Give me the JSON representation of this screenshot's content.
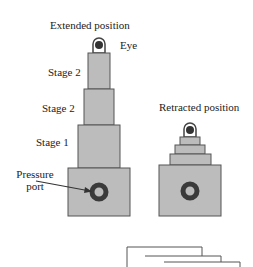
{
  "title_extended": "Extended position",
  "title_retracted": "Retracted position",
  "labels": {
    "eye": "Eye",
    "stage_top": "Stage 2",
    "stage_mid": "Stage 2",
    "stage_bottom": "Stage 1",
    "pressure_port_line1": "Pressure",
    "pressure_port_line2": "port"
  },
  "colors": {
    "fill": "#bcbcbc",
    "stroke": "#555555",
    "port": "#3a3a3a"
  }
}
